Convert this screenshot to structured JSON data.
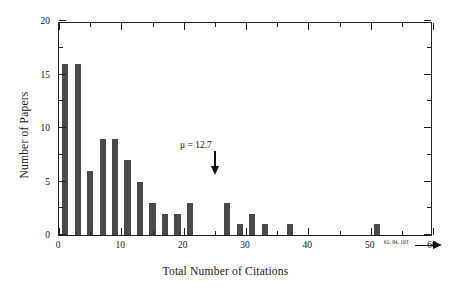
{
  "chart_data": {
    "type": "bar",
    "title": "",
    "xlabel": "Total Number of Citations",
    "ylabel": "Number of Papers",
    "xlim": [
      0,
      60
    ],
    "ylim": [
      0,
      20
    ],
    "bin_width": 1,
    "grid": false,
    "legend": null,
    "x_major_ticks": [
      0,
      10,
      20,
      30,
      40,
      50,
      60
    ],
    "x_minor_ticks": [
      5,
      15,
      25,
      35,
      45,
      55
    ],
    "y_major_ticks": [
      0,
      5,
      10,
      15,
      20
    ],
    "y_minor_ticks": [
      2.5,
      7.5,
      12.5,
      17.5
    ],
    "x_tick_labels": [
      "0",
      "10",
      "20",
      "30",
      "40",
      "50",
      "60"
    ],
    "y_tick_labels": [
      "0",
      "5",
      "10",
      "15",
      "20"
    ],
    "bar_color": "#4a4a4a",
    "x": [
      1,
      3,
      5,
      7,
      9,
      11,
      13,
      15,
      17,
      19,
      21,
      27,
      29,
      31,
      33,
      37,
      51
    ],
    "values": [
      16,
      16,
      6,
      9,
      9,
      7,
      5,
      3,
      2,
      2,
      3,
      3,
      1,
      2,
      1,
      1,
      1
    ],
    "annotations": [
      {
        "name": "mean-marker",
        "text": "μ = 12.7",
        "x": 12.7,
        "value": 12.7
      },
      {
        "name": "outlier-callout",
        "text": "61, 84, 103",
        "x": 51
      }
    ]
  }
}
